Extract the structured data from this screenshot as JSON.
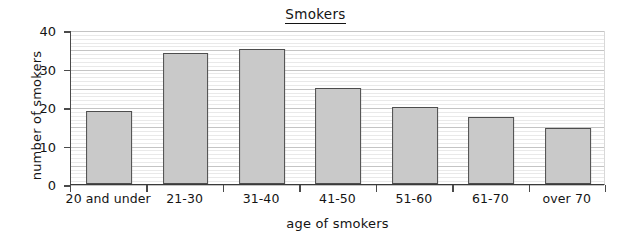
{
  "chart_data": {
    "type": "bar",
    "title": "Smokers",
    "xlabel": "age of smokers",
    "ylabel": "number of smokers",
    "categories": [
      "20 and under",
      "21-30",
      "31-40",
      "41-50",
      "51-60",
      "61-70",
      "over 70"
    ],
    "values": [
      19,
      34,
      35,
      25,
      20,
      17.5,
      14.5
    ],
    "ylim": [
      0,
      40
    ],
    "ytick_labels": [
      "0",
      "10",
      "20",
      "30",
      "40"
    ],
    "ytick_values": [
      0,
      10,
      20,
      30,
      40
    ],
    "grid": {
      "horizontal": true,
      "minor_step": 1,
      "major_step": 5,
      "vertical": false
    },
    "legend": null,
    "colors": {
      "bar_fill": "#c9c9c9",
      "bar_border": "#4d4d4d",
      "axis": "#3a3a3a",
      "gridline_minor": "#e9e9e9",
      "gridline_major": "#c4c4c4",
      "text": "#141414",
      "background": "#ffffff"
    },
    "title_underlined": true
  }
}
